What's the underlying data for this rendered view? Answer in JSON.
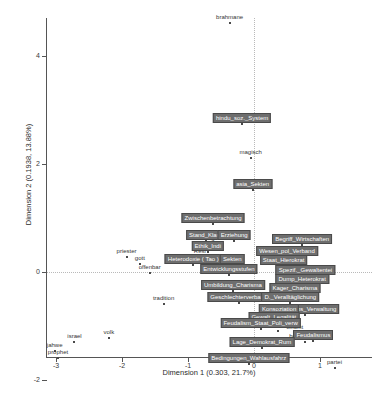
{
  "chart_data": {
    "type": "scatter",
    "title": "",
    "xlabel": "Dimension 1  (0.303,  21.7%)",
    "ylabel": "Dimension 2  (0.1938,  13.88%)",
    "xlim": [
      -3.45,
      1.75
    ],
    "ylim": [
      -2.15,
      5.6
    ],
    "xticks": [
      -3,
      -2,
      -1,
      0,
      1
    ],
    "yticks": [
      -2,
      0,
      2,
      4
    ],
    "grid": false,
    "legend": null,
    "zero_reference_lines": true,
    "series": [
      {
        "name": "terms",
        "style": "plain-label",
        "points": [
          {
            "label": "kaste",
            "x": 0.03,
            "y": 5.2
          },
          {
            "label": "brahmane",
            "x": -0.37,
            "y": 4.62
          },
          {
            "label": "magisch",
            "x": -0.05,
            "y": 2.12
          },
          {
            "label": "priester",
            "x": -1.93,
            "y": 0.28
          },
          {
            "label": "gott",
            "x": -1.73,
            "y": 0.14
          },
          {
            "label": "offenbar",
            "x": -1.58,
            "y": -0.02
          },
          {
            "label": "tradition",
            "x": -1.37,
            "y": -0.6
          },
          {
            "label": "volk",
            "x": -2.2,
            "y": -1.23
          },
          {
            "label": "israel",
            "x": -2.72,
            "y": -1.3
          },
          {
            "label": "jahwe",
            "x": -3.02,
            "y": -1.47
          },
          {
            "label": "prophet",
            "x": -2.97,
            "y": -1.6
          },
          {
            "label": "staat",
            "x": 0.37,
            "y": -1.1
          },
          {
            "label": "beamt",
            "x": 0.62,
            "y": -1.13
          },
          {
            "label": "burokratisch",
            "x": 0.78,
            "y": -1.3
          },
          {
            "label": "partei",
            "x": 1.22,
            "y": -1.78
          },
          {
            "label": "Wag",
            "x": -0.69,
            "y": 0.52
          },
          {
            "label": "Resi",
            "x": -0.82,
            "y": 0.28
          }
        ]
      },
      {
        "name": "chapters",
        "style": "boxed-label",
        "points": [
          {
            "label": "hindu_soz._System",
            "x": -0.18,
            "y": 2.74
          },
          {
            "label": "asia_Sekten",
            "x": -0.02,
            "y": 1.52
          },
          {
            "label": "Zwischenbetrachtung",
            "x": -0.62,
            "y": 0.88
          },
          {
            "label": "Stand_Klass",
            "x": -0.73,
            "y": 0.57
          },
          {
            "label": "Erziehung",
            "x": -0.3,
            "y": 0.57
          },
          {
            "label": "Ethik_Indi",
            "x": -0.7,
            "y": 0.37
          },
          {
            "label": "Heterodoxie ( Tao )",
            "x": -0.92,
            "y": 0.13
          },
          {
            "label": "Sekten",
            "x": -0.33,
            "y": 0.13
          },
          {
            "label": "Begriff_Wirtschaften",
            "x": 0.73,
            "y": 0.5
          },
          {
            "label": "Wesen_pol_Verband",
            "x": 0.5,
            "y": 0.28
          },
          {
            "label": "Staat_Hierokrat",
            "x": 0.45,
            "y": 0.12
          },
          {
            "label": "Entwicklungsstufen",
            "x": -0.38,
            "y": -0.06
          },
          {
            "label": "Spezif._Gewaltentei",
            "x": 0.78,
            "y": -0.07
          },
          {
            "label": "Umbildung_Charisma",
            "x": -0.32,
            "y": -0.36
          },
          {
            "label": "Dump_Heterokrat",
            "x": 0.73,
            "y": -0.24
          },
          {
            "label": "Kager_Charisma",
            "x": 0.62,
            "y": -0.4
          },
          {
            "label": "Geschlechterverband",
            "x": -0.23,
            "y": -0.57
          },
          {
            "label": "D._Veralltäglichung",
            "x": 0.55,
            "y": -0.57
          },
          {
            "label": "Bühmanns_Verwaltung",
            "x": 0.78,
            "y": -0.8
          },
          {
            "label": "Konsoziation",
            "x": 0.38,
            "y": -0.8
          },
          {
            "label": "Gewalt_Legalität",
            "x": 0.3,
            "y": -0.95
          },
          {
            "label": "Feudalism_Staat_Poli_verw",
            "x": 0.1,
            "y": -1.06
          },
          {
            "label": "Feudalismus",
            "x": 0.9,
            "y": -1.28
          },
          {
            "label": "Lage_Demokrat_Rum",
            "x": 0.12,
            "y": -1.4
          },
          {
            "label": "Bedingungen_Wahlausfahrz",
            "x": -0.08,
            "y": -1.7
          }
        ]
      }
    ]
  },
  "axis": {
    "x_title": "Dimension 1  (0.303,  21.7%)",
    "y_title": "Dimension 2  (0.1938,  13.88%)",
    "x_tick_labels": [
      "-3",
      "-2",
      "-1",
      "0",
      "1"
    ],
    "y_tick_labels": [
      "-2",
      "0",
      "2",
      "4"
    ]
  },
  "caption": ""
}
